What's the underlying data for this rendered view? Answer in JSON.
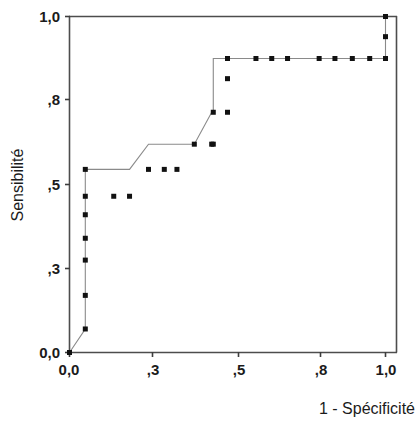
{
  "chart_data": {
    "type": "line",
    "title": "",
    "subtitle": "",
    "xlabel": "1 - Spécificité",
    "ylabel": "Sensibilité",
    "xlim": [
      0.0,
      1.0
    ],
    "ylim": [
      0.0,
      1.0
    ],
    "grid": false,
    "legend": null,
    "legend_position": "none",
    "marker": "square",
    "marker_color": "#111111",
    "line_color": "#8a8a8a",
    "xticks": [
      0.0,
      0.3,
      0.5,
      0.8,
      1.0
    ],
    "xtick_labels": [
      "0,0",
      ",3",
      ",5",
      ",8",
      "1,0"
    ],
    "yticks": [
      0.0,
      0.3,
      0.5,
      0.8,
      1.0
    ],
    "ytick_labels": [
      "0,0",
      ",3",
      ",5",
      ",8",
      "1,0"
    ],
    "series": [
      {
        "name": "ROC",
        "x": [
          0.0,
          0.05,
          0.05,
          0.05,
          0.05,
          0.05,
          0.05,
          0.05,
          0.14,
          0.19,
          0.19,
          0.25,
          0.3,
          0.34,
          0.34,
          0.395,
          0.45,
          0.455,
          0.455,
          0.455,
          0.5,
          0.5,
          0.59,
          0.64,
          0.69,
          0.79,
          0.84,
          0.895,
          0.95,
          1.0,
          1.0,
          1.0
        ],
        "y": [
          0.0,
          0.07,
          0.17,
          0.275,
          0.34,
          0.41,
          0.465,
          0.545,
          0.545,
          0.545,
          0.545,
          0.62,
          0.62,
          0.62,
          0.62,
          0.62,
          0.715,
          0.715,
          0.815,
          0.875,
          0.875,
          0.875,
          0.875,
          0.875,
          0.875,
          0.875,
          0.875,
          0.875,
          0.875,
          0.875,
          0.94,
          1.0
        ]
      }
    ],
    "points": [
      {
        "x": 0.0,
        "y": 0.0
      },
      {
        "x": 0.05,
        "y": 0.07
      },
      {
        "x": 0.05,
        "y": 0.17
      },
      {
        "x": 0.05,
        "y": 0.275
      },
      {
        "x": 0.05,
        "y": 0.34
      },
      {
        "x": 0.05,
        "y": 0.41
      },
      {
        "x": 0.05,
        "y": 0.465
      },
      {
        "x": 0.05,
        "y": 0.545
      },
      {
        "x": 0.14,
        "y": 0.465
      },
      {
        "x": 0.19,
        "y": 0.465
      },
      {
        "x": 0.25,
        "y": 0.545
      },
      {
        "x": 0.3,
        "y": 0.545
      },
      {
        "x": 0.34,
        "y": 0.545
      },
      {
        "x": 0.395,
        "y": 0.62
      },
      {
        "x": 0.45,
        "y": 0.62
      },
      {
        "x": 0.455,
        "y": 0.62
      },
      {
        "x": 0.5,
        "y": 0.715
      },
      {
        "x": 0.455,
        "y": 0.715
      },
      {
        "x": 0.5,
        "y": 0.815
      },
      {
        "x": 0.5,
        "y": 0.875
      },
      {
        "x": 0.59,
        "y": 0.875
      },
      {
        "x": 0.64,
        "y": 0.875
      },
      {
        "x": 0.69,
        "y": 0.875
      },
      {
        "x": 0.79,
        "y": 0.875
      },
      {
        "x": 0.84,
        "y": 0.875
      },
      {
        "x": 0.895,
        "y": 0.875
      },
      {
        "x": 0.95,
        "y": 0.875
      },
      {
        "x": 1.0,
        "y": 0.875
      },
      {
        "x": 1.0,
        "y": 0.94
      },
      {
        "x": 1.0,
        "y": 1.0
      }
    ]
  },
  "axes": {
    "y_title": "Sensibilité",
    "x_title": "1 - Spécificité",
    "y_tick_labels": [
      "1,0",
      ",8",
      ",5",
      ",3",
      "0,0"
    ],
    "x_tick_labels": [
      "0,0",
      ",3",
      ",5",
      ",8",
      "1,0"
    ]
  }
}
